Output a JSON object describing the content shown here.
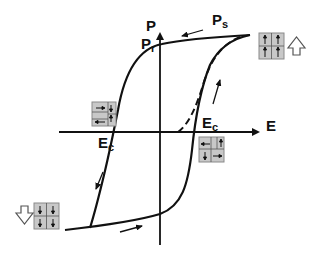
{
  "diagram": {
    "axes": {
      "x_label": "E",
      "y_label": "P"
    },
    "labels": {
      "saturation": {
        "main": "P",
        "sub": "s"
      },
      "remanent": {
        "main": "P",
        "sub": "r"
      },
      "coercive_left": {
        "main": "E",
        "sub": "c"
      },
      "coercive_right": {
        "main": "E",
        "sub": "c"
      }
    },
    "curves": [
      {
        "name": "upper-branch",
        "style": "solid"
      },
      {
        "name": "lower-branch",
        "style": "solid"
      },
      {
        "name": "initial-polarization",
        "style": "dashed"
      }
    ],
    "domain_states": [
      {
        "name": "saturated-up",
        "position": "top-right",
        "arrow": "up"
      },
      {
        "name": "mixed-at-negative-coercive",
        "position": "left-center",
        "arrow": "none"
      },
      {
        "name": "mixed-at-positive-coercive",
        "position": "right-center",
        "arrow": "none"
      },
      {
        "name": "saturated-down",
        "position": "bottom-left",
        "arrow": "down"
      }
    ],
    "colors": {
      "line": "#111111",
      "domain_fill": "#c8c8c8",
      "domain_border": "#8a8a8a",
      "background": "#ffffff"
    }
  }
}
